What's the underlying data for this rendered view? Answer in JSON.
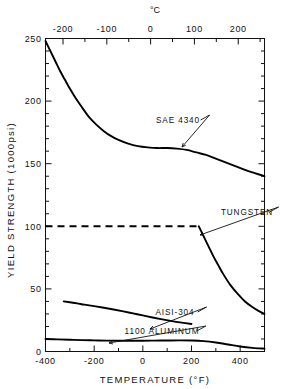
{
  "chart_data": {
    "type": "line",
    "title": "",
    "xlabel": "TEMPERATURE (°F)",
    "ylabel": "YIELD STRENGTH (1000psi)",
    "secondary_xlabel": "°C",
    "xlim": [
      -400,
      500
    ],
    "ylim": [
      0,
      250
    ],
    "grid": false,
    "legend": "inline-annotations",
    "x_ticks": [
      -400,
      -200,
      0,
      200,
      400
    ],
    "x_tick_labels": [
      "-400",
      "-200",
      "0",
      "200",
      "400"
    ],
    "x_minor_step": 100,
    "y_ticks": [
      0,
      50,
      100,
      150,
      200,
      250
    ],
    "y_tick_labels": [
      "0",
      "50",
      "100",
      "150",
      "200",
      "250"
    ],
    "y_minor_step": 10,
    "secondary_x_ticks": [
      -200,
      -100,
      0,
      100,
      200
    ],
    "secondary_x_tick_labels": [
      "-200",
      "-100",
      "0",
      "100",
      "200"
    ],
    "secondary_x_minor_step": 50,
    "series": [
      {
        "name": "SAE 4340",
        "style": "solid",
        "color": "#000000",
        "x": [
          -400,
          -380,
          -360,
          -340,
          -320,
          -300,
          -275,
          -250,
          -220,
          -190,
          -160,
          -130,
          -100,
          -60,
          -20,
          20,
          60,
          100,
          140,
          180,
          220,
          260,
          300,
          340,
          380,
          420,
          460,
          500
        ],
        "y": [
          248,
          240,
          232,
          224,
          217,
          210,
          202,
          195,
          187,
          181,
          176,
          172,
          169,
          166,
          164,
          163,
          162.5,
          162.5,
          162,
          161,
          159,
          157,
          154,
          151,
          148,
          145,
          142.5,
          140
        ]
      },
      {
        "name": "TUNGSTEN",
        "style": "dashed-then-solid",
        "color": "#000000",
        "dash_x": [
          -400,
          230
        ],
        "dash_y": [
          100,
          100
        ],
        "x": [
          230,
          250,
          270,
          290,
          310,
          330,
          360,
          390,
          420,
          450,
          475,
          500
        ],
        "y": [
          100,
          92,
          84,
          76,
          69,
          62,
          53,
          46,
          40,
          35.5,
          32.5,
          30
        ]
      },
      {
        "name": "AISI-304",
        "style": "solid",
        "color": "#000000",
        "x": [
          -325,
          -300,
          -270,
          -240,
          -200,
          -160,
          -120,
          -80,
          -40,
          0,
          40,
          80,
          120,
          160,
          200
        ],
        "y": [
          40,
          39.3,
          38.4,
          37.4,
          36.2,
          34.9,
          33.5,
          32,
          30.4,
          28.8,
          27.2,
          25.7,
          24.3,
          23.1,
          22
        ]
      },
      {
        "name": "1100 ALUMINUM",
        "style": "solid",
        "color": "#000000",
        "x": [
          -400,
          -350,
          -300,
          -250,
          -200,
          -150,
          -100,
          -50,
          0,
          50,
          100,
          150,
          200,
          250,
          300,
          350,
          400,
          450,
          500
        ],
        "y": [
          10,
          9.7,
          9.4,
          9.1,
          8.9,
          8.7,
          8.6,
          8.6,
          8.6,
          8.7,
          8.8,
          8.9,
          8.8,
          8.3,
          7.2,
          5.6,
          4.0,
          2.9,
          2.3
        ]
      }
    ],
    "annotations": [
      {
        "label": "SAE 4340",
        "label_x": 178,
        "label_y": 123,
        "point_x": 182,
        "point_y": 147
      },
      {
        "label": "TUNGSTEN",
        "label_x": 247,
        "label_y": 215,
        "point_x": 200,
        "point_y": 235
      },
      {
        "label": "AISI-304",
        "label_x": 175,
        "label_y": 315,
        "point_x": 150,
        "point_y": 329
      },
      {
        "label": "1100 ALUMINUM",
        "label_x": 162,
        "label_y": 334,
        "point_x": 109,
        "point_y": 343
      }
    ]
  }
}
